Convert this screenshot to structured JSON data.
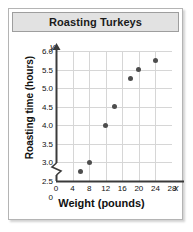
{
  "chart_data": {
    "type": "scatter",
    "title": "Roasting Turkeys",
    "xlabel": "Weight (pounds)",
    "ylabel": "Roasting time (hours)",
    "x_axis_variable": "x",
    "y_axis_variable": "y",
    "xlim": [
      0,
      28
    ],
    "ylim": [
      2.5,
      6.0
    ],
    "y_axis_break": true,
    "y_origin_label": "0",
    "grid": true,
    "legend": null,
    "xticks": [
      0,
      4,
      8,
      12,
      16,
      20,
      24,
      28
    ],
    "xtick_labels": [
      "0",
      "4",
      "8",
      "12",
      "16",
      "20",
      "24",
      "28"
    ],
    "yticks": [
      2.5,
      3.0,
      3.5,
      4.0,
      4.5,
      5.0,
      5.5,
      6.0
    ],
    "ytick_labels": [
      "2.5",
      "3.0",
      "3.5",
      "4.0",
      "4.5",
      "5.0",
      "5.5",
      "6.0"
    ],
    "points": [
      {
        "x": 6,
        "y": 2.75
      },
      {
        "x": 8,
        "y": 3.0
      },
      {
        "x": 12,
        "y": 4.0
      },
      {
        "x": 14,
        "y": 4.5
      },
      {
        "x": 18,
        "y": 5.25
      },
      {
        "x": 20,
        "y": 5.5
      },
      {
        "x": 24,
        "y": 5.75
      }
    ],
    "marker_color": "#4d4d4d",
    "grid_color": "#d6d6d6",
    "axis_color": "#3a3a3a"
  },
  "frame": {
    "title_bar_bg": "#e2e2e2",
    "border_color": "#b4b4b4"
  }
}
